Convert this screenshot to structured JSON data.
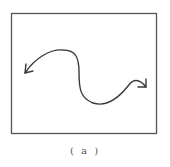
{
  "figure": {
    "caption": "( a )",
    "frame": {
      "x": 11,
      "y": 13,
      "width": 146,
      "height": 121,
      "stroke": "#555555"
    },
    "curve": {
      "stroke": "#3a3a3a",
      "description": "S-shaped wavy line with arrowheads at both ends",
      "start_arrow": "left-down",
      "end_arrow": "right-down"
    },
    "icons": {
      "left_arrow": "arrowhead-left-icon",
      "right_arrow": "arrowhead-right-icon"
    }
  }
}
